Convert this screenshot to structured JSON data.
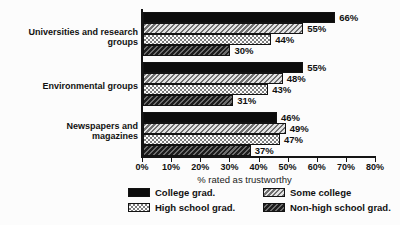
{
  "chart_data": {
    "type": "bar",
    "orientation": "horizontal",
    "title": "",
    "xlabel": "% rated as trustworthy",
    "xlim": [
      0,
      80
    ],
    "xticks": [
      "0%",
      "10%",
      "20%",
      "30%",
      "40%",
      "50%",
      "60%",
      "70%",
      "80%"
    ],
    "grid": false,
    "legend_position": "bottom",
    "value_label_suffix": "%",
    "categories": [
      "Universities and research groups",
      "Environmental groups",
      "Newspapers and magazines"
    ],
    "series": [
      {
        "name": "College grad.",
        "pattern": "solid",
        "values": [
          66,
          55,
          46
        ]
      },
      {
        "name": "Some college",
        "pattern": "light-hatch",
        "values": [
          55,
          48,
          49
        ]
      },
      {
        "name": "High school grad.",
        "pattern": "dot-stipple",
        "values": [
          44,
          43,
          47
        ]
      },
      {
        "name": "Non-high school grad.",
        "pattern": "dark-hatch",
        "values": [
          30,
          31,
          37
        ]
      }
    ]
  },
  "colors": {
    "background": "#fcfcfc",
    "bar_solid": "#0c0c0c",
    "hatch_light": "#6f6f6f",
    "hatch_dark": "#1d1d1d",
    "axis": "#151515"
  }
}
